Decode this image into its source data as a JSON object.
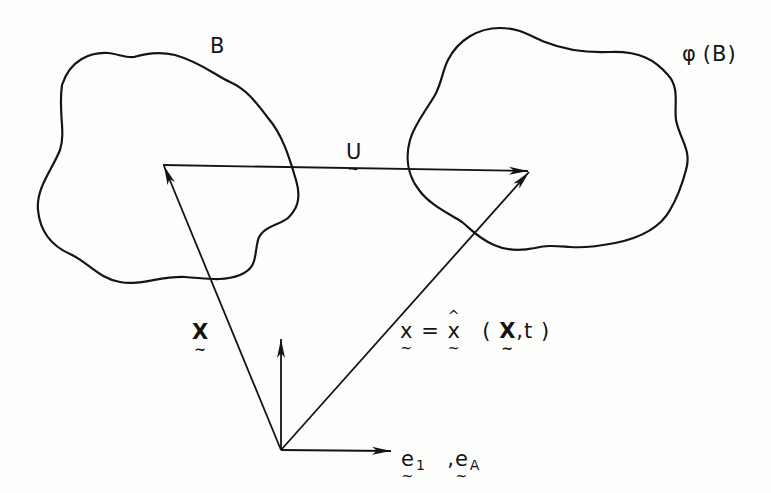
{
  "figure": {
    "body_label": "B",
    "mapped_body_label": "φ(B)",
    "mapped_body_label_parts": {
      "phi": "φ",
      "open": "(",
      "inner": "B",
      "close": ")"
    },
    "displacement_label": "U",
    "reference_position_label": "X",
    "motion_equation": {
      "full": "x = x̂ (X, t)",
      "lhs": "x",
      "equals": "=",
      "func": "x",
      "open": "(",
      "arg1": "X",
      "comma": ",",
      "arg2": "t",
      "close": ")"
    },
    "basis_label": {
      "full": "e1 , eA",
      "e1_base": "e",
      "e1_sub": "1",
      "sep": ",",
      "eA_base": "e",
      "eA_sub": "A"
    },
    "vectors": [
      {
        "name": "X",
        "from": [
          281,
          450
        ],
        "to": [
          163,
          165
        ],
        "description": "reference position vector"
      },
      {
        "name": "x",
        "from": [
          281,
          450
        ],
        "to": [
          530,
          171
        ],
        "description": "current position vector"
      },
      {
        "name": "U",
        "from": [
          163,
          165
        ],
        "to": [
          530,
          171
        ],
        "description": "displacement vector"
      },
      {
        "name": "basis-vertical",
        "from": [
          281,
          450
        ],
        "to": [
          281,
          338
        ]
      },
      {
        "name": "basis-horizontal",
        "from": [
          281,
          450
        ],
        "to": [
          392,
          451
        ]
      }
    ],
    "colors": {
      "ink": "#141414",
      "paper": "#fdfdfc"
    }
  }
}
